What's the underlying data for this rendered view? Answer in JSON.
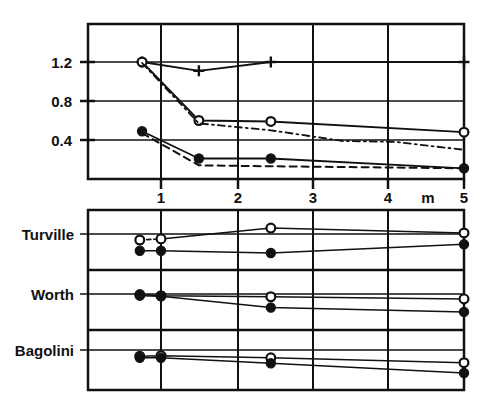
{
  "figure": {
    "width": 496,
    "height": 418,
    "background": "#ffffff",
    "ink": "#111111"
  },
  "chart_data": [
    {
      "id": "upper-panel",
      "type": "line",
      "title": "",
      "xlabel": "m",
      "ylabel": "",
      "xlim": [
        0.5,
        5.0
      ],
      "ylim": [
        0.0,
        1.45
      ],
      "xticks": [
        1,
        2,
        3,
        4,
        5
      ],
      "xticklabels": [
        "1",
        "2",
        "3",
        "4",
        "5"
      ],
      "yticks": [
        0.4,
        0.8,
        1.2
      ],
      "yticklabels": [
        "0.4",
        "0.8",
        "1.2"
      ],
      "grid": "both",
      "legend": "none",
      "series": [
        {
          "name": "plus-solid",
          "marker": "plus",
          "line": "solid",
          "x": [
            0.75,
            1.5,
            2.45,
            5.0
          ],
          "y": [
            1.2,
            1.11,
            1.2,
            1.2
          ]
        },
        {
          "name": "open-circle-solid",
          "marker": "open-circle",
          "line": "solid",
          "x": [
            0.75,
            1.5,
            2.45,
            5.0
          ],
          "y": [
            1.2,
            0.6,
            0.59,
            0.48
          ]
        },
        {
          "name": "open-circle-dashed",
          "marker": "none",
          "line": "dash-dot",
          "x": [
            0.75,
            1.5,
            2.45,
            3.4,
            4.1,
            5.0
          ],
          "y": [
            1.19,
            0.57,
            0.5,
            0.39,
            0.38,
            0.3
          ]
        },
        {
          "name": "filled-circle-solid",
          "marker": "filled-circle",
          "line": "solid",
          "x": [
            0.75,
            1.5,
            2.45,
            5.0
          ],
          "y": [
            0.49,
            0.21,
            0.21,
            0.11
          ]
        },
        {
          "name": "filled-circle-dashed",
          "marker": "none",
          "line": "dashed",
          "x": [
            0.75,
            1.5,
            2.45,
            5.0
          ],
          "y": [
            0.47,
            0.14,
            0.13,
            0.11
          ]
        }
      ]
    },
    {
      "id": "lower-panel",
      "type": "line",
      "title": "",
      "xlabel": "",
      "ylabel": "",
      "xlim": [
        0.5,
        5.0
      ],
      "grid": "vertical",
      "legend": "none",
      "rows": [
        {
          "label": "Turville",
          "baseline": 0.72,
          "series": [
            {
              "name": "open-circle",
              "marker": "open-circle",
              "line": "dashed-then-solid",
              "x": [
                0.72,
                1.0,
                2.45,
                5.0
              ],
              "y": [
                0.5,
                0.52,
                0.72,
                0.63
              ]
            },
            {
              "name": "filled-circle",
              "marker": "filled-circle",
              "line": "solid",
              "x": [
                0.72,
                1.0,
                2.45,
                5.0
              ],
              "y": [
                0.3,
                0.3,
                0.26,
                0.42
              ]
            }
          ]
        },
        {
          "label": "Worth",
          "baseline": 0.58,
          "series": [
            {
              "name": "open-circle",
              "marker": "open-circle",
              "line": "solid",
              "x": [
                0.72,
                1.0,
                2.45,
                5.0
              ],
              "y": [
                0.6,
                0.58,
                0.56,
                0.52
              ]
            },
            {
              "name": "filled-circle",
              "marker": "filled-circle",
              "line": "solid",
              "x": [
                0.72,
                1.0,
                2.45,
                5.0
              ],
              "y": [
                0.58,
                0.57,
                0.36,
                0.28
              ]
            }
          ]
        },
        {
          "label": "Bagolini",
          "baseline": 0.56,
          "series": [
            {
              "name": "open-circle",
              "marker": "open-circle",
              "line": "solid",
              "x": [
                0.72,
                1.0,
                2.45,
                5.0
              ],
              "y": [
                0.57,
                0.58,
                0.54,
                0.45
              ]
            },
            {
              "name": "filled-circle",
              "marker": "filled-circle",
              "line": "solid",
              "x": [
                0.72,
                1.0,
                2.45,
                5.0
              ],
              "y": [
                0.54,
                0.54,
                0.44,
                0.26
              ]
            }
          ]
        }
      ]
    }
  ],
  "upper_axis": {
    "ylabels": [
      "1.2",
      "0.8",
      "0.4"
    ],
    "xlabels": [
      "1",
      "2",
      "3",
      "4",
      "5"
    ],
    "unit_label": "m"
  },
  "lower_axis": {
    "row_labels": [
      "Turville",
      "Worth",
      "Bagolini"
    ]
  }
}
